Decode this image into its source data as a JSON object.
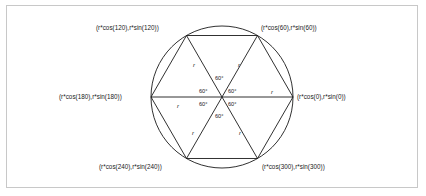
{
  "figure": {
    "background_color": "#ffffff",
    "frame_color": "#c8c8c8",
    "stroke_color": "#1a1a1a",
    "text_color": "#1a1a1a"
  },
  "geometry": {
    "center_x": 222,
    "center_y": 97,
    "radius": 71,
    "vertex_count": 6,
    "vertex_angles_deg": [
      0,
      60,
      120,
      180,
      240,
      300
    ]
  },
  "vertex_labels": [
    {
      "id": "vertex-120",
      "text": "(r*cos(120),r*sin(120))",
      "angle_deg": 120,
      "x": 96,
      "y": 25,
      "align": "left"
    },
    {
      "id": "vertex-60",
      "text": "(r*cos(60),r*sin(60))",
      "angle_deg": 60,
      "x": 261,
      "y": 25,
      "align": "left"
    },
    {
      "id": "vertex-180",
      "text": "(r*cos(180),r*sin(180))",
      "angle_deg": 180,
      "x": 59,
      "y": 94,
      "align": "left"
    },
    {
      "id": "vertex-0",
      "text": "(r*cos(0),r*sin(0))",
      "angle_deg": 0,
      "x": 297,
      "y": 94,
      "align": "left"
    },
    {
      "id": "vertex-240",
      "text": "(r*cos(240),r*sin(240))",
      "angle_deg": 240,
      "x": 99,
      "y": 164,
      "align": "left"
    },
    {
      "id": "vertex-300",
      "text": "(r*cos(300),r*sin(300))",
      "angle_deg": 300,
      "x": 262,
      "y": 164,
      "align": "left"
    }
  ],
  "angle_labels": [
    {
      "id": "angle-top",
      "text": "60°",
      "x": 215,
      "y": 76
    },
    {
      "id": "angle-upper-left",
      "text": "60°",
      "x": 199,
      "y": 89
    },
    {
      "id": "angle-upper-right",
      "text": "60°",
      "x": 228,
      "y": 89
    },
    {
      "id": "angle-lower-left",
      "text": "60°",
      "x": 199,
      "y": 102
    },
    {
      "id": "angle-lower-right",
      "text": "60°",
      "x": 228,
      "y": 102
    },
    {
      "id": "angle-bottom",
      "text": "60°",
      "x": 215,
      "y": 114
    }
  ],
  "radius_labels": [
    {
      "id": "radius-upper-left",
      "text": "r",
      "x": 193,
      "y": 62
    },
    {
      "id": "radius-upper-right",
      "text": "r",
      "x": 238,
      "y": 62
    },
    {
      "id": "radius-right",
      "text": "r",
      "x": 271,
      "y": 89
    },
    {
      "id": "radius-left",
      "text": "r",
      "x": 177,
      "y": 103
    },
    {
      "id": "radius-lower-left",
      "text": "r",
      "x": 192,
      "y": 130
    },
    {
      "id": "radius-lower-right",
      "text": "r",
      "x": 239,
      "y": 130
    }
  ]
}
